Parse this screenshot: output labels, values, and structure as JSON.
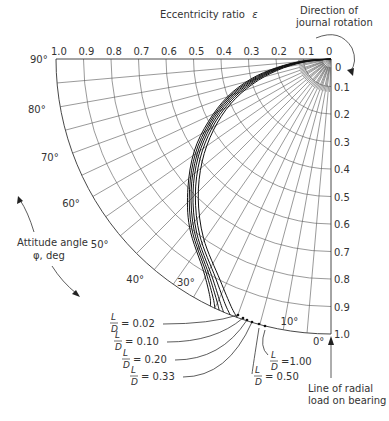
{
  "chart_data": {
    "type": "line",
    "subtype": "polar-locus",
    "title": "",
    "axis_labels": {
      "eccentricity": "Eccentricity ratio",
      "eccentricity_symbol": "ε",
      "attitude": "Attitude angle",
      "attitude_units": "φ, deg"
    },
    "eccentricity_ticks_top": [
      "1.0",
      "0.9",
      "0.8",
      "0.7",
      "0.6",
      "0.5",
      "0.4",
      "0.3",
      "0.2",
      "0.1",
      "0"
    ],
    "eccentricity_ticks_right": [
      "0",
      "0.1",
      "0.2",
      "0.3",
      "0.4",
      "0.5",
      "0.6",
      "0.7",
      "0.8",
      "0.9",
      "1.0"
    ],
    "angle_ticks": [
      "90°",
      "80°",
      "70°",
      "60°",
      "50°",
      "40°",
      "30°",
      "10°",
      "0°"
    ],
    "annotations": {
      "rotation": [
        "Direction of",
        "journal rotation"
      ],
      "load_line": [
        "Line of radial",
        "load on bearing"
      ]
    },
    "rlim": [
      0,
      1.0
    ],
    "theta_range_deg": [
      0,
      90
    ],
    "grid": true,
    "series": [
      {
        "name": "L/D = 0.02",
        "label_num": "0.02",
        "eps": [
          0,
          0.1,
          0.2,
          0.3,
          0.4,
          0.5,
          0.6,
          0.7,
          0.8,
          0.9,
          0.97,
          1.0
        ],
        "phi": [
          90,
          86,
          81,
          76,
          70,
          63,
          56,
          48,
          40,
          31,
          27,
          26
        ]
      },
      {
        "name": "L/D = 0.10",
        "label_num": "0.10",
        "eps": [
          0,
          0.1,
          0.2,
          0.3,
          0.4,
          0.5,
          0.6,
          0.7,
          0.8,
          0.9,
          0.97,
          1.0
        ],
        "phi": [
          90,
          85.5,
          80.5,
          75.3,
          69.3,
          62.3,
          55.2,
          47.3,
          39.2,
          30.3,
          26.2,
          25
        ]
      },
      {
        "name": "L/D = 0.20",
        "label_num": "0.20",
        "eps": [
          0,
          0.1,
          0.2,
          0.3,
          0.4,
          0.5,
          0.6,
          0.7,
          0.8,
          0.9,
          0.97,
          1.0
        ],
        "phi": [
          90,
          85,
          80,
          74.6,
          68.6,
          61.6,
          54.4,
          46.6,
          38.4,
          29.6,
          25.4,
          24
        ]
      },
      {
        "name": "L/D = 0.33",
        "label_num": "0.33",
        "eps": [
          0,
          0.1,
          0.2,
          0.3,
          0.4,
          0.5,
          0.6,
          0.7,
          0.8,
          0.9,
          0.97,
          1.0
        ],
        "phi": [
          90,
          84.5,
          79.4,
          73.9,
          67.8,
          60.8,
          53.6,
          45.8,
          37.6,
          28.8,
          24.6,
          23
        ]
      },
      {
        "name": "L/D = 0.50",
        "label_num": "0.50",
        "eps": [
          0,
          0.1,
          0.2,
          0.3,
          0.4,
          0.5,
          0.6,
          0.7,
          0.8,
          0.9,
          0.97,
          1.0
        ],
        "phi": [
          90,
          84,
          78.8,
          73.1,
          66.9,
          59.9,
          52.6,
          44.8,
          36.6,
          27.8,
          23.4,
          21.5
        ]
      },
      {
        "name": "L/D = 1.00",
        "label_num": "1.00",
        "eps": [
          0,
          0.1,
          0.2,
          0.3,
          0.4,
          0.5,
          0.6,
          0.7,
          0.8,
          0.9,
          0.97,
          1.0
        ],
        "phi": [
          90,
          83.4,
          78,
          72.2,
          65.9,
          58.8,
          51.4,
          43.6,
          35.4,
          26.6,
          22,
          20
        ]
      }
    ],
    "legend_labels": [
      {
        "prefix_num": "L",
        "prefix_den": "D",
        "value": "= 0.02"
      },
      {
        "prefix_num": "L",
        "prefix_den": "D",
        "value": "= 0.10"
      },
      {
        "prefix_num": "L",
        "prefix_den": "D",
        "value": "= 0.20"
      },
      {
        "prefix_num": "L",
        "prefix_den": "D",
        "value": "= 0.33"
      },
      {
        "prefix_num": "L",
        "prefix_den": "D",
        "value": "= 0.50"
      },
      {
        "prefix_num": "L",
        "prefix_den": "D",
        "value": "=1.00"
      }
    ],
    "colors": {
      "line": "#111111",
      "grid": "#555555",
      "text": "#333333",
      "background": "#ffffff"
    }
  }
}
